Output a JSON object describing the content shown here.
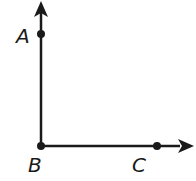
{
  "diagram": {
    "type": "right angle formed by two rays",
    "points": [
      {
        "label": "A",
        "x": 41,
        "y": 34
      },
      {
        "label": "B",
        "x": 41,
        "y": 146
      },
      {
        "label": "C",
        "x": 157,
        "y": 146
      }
    ],
    "rays": [
      {
        "name": "ray BA",
        "from": "B",
        "through": "A"
      },
      {
        "name": "ray BC",
        "from": "B",
        "through": "C"
      }
    ],
    "colors": {
      "stroke": "#1a1a1a",
      "background": "#ffffff"
    }
  }
}
